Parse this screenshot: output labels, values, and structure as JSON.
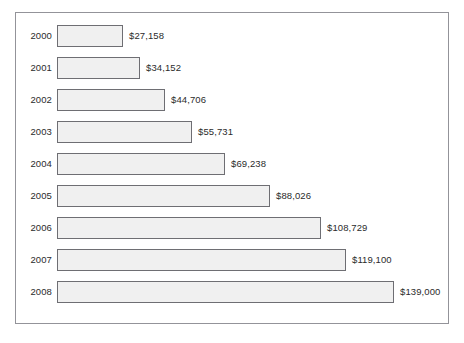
{
  "chart_data": {
    "type": "bar",
    "orientation": "horizontal",
    "title": "",
    "subtitle": "",
    "xlabel": "",
    "ylabel": "",
    "grid": false,
    "legend": false,
    "legend_position": "none",
    "axis_visible": false,
    "xlim": [
      0,
      139000
    ],
    "categories": [
      "2000",
      "2001",
      "2002",
      "2003",
      "2004",
      "2005",
      "2006",
      "2007",
      "2008"
    ],
    "values": [
      27158,
      34152,
      44706,
      55731,
      69238,
      88026,
      108729,
      119100,
      139000
    ],
    "value_labels": [
      "$27,158",
      "$34,152",
      "$44,706",
      "$55,731",
      "$69,238",
      "$88,026",
      "$108,729",
      "$119,100",
      "$139,000"
    ],
    "bars": [
      {
        "category": "2000",
        "value": 27158,
        "label": "$27,158"
      },
      {
        "category": "2001",
        "value": 34152,
        "label": "$34,152"
      },
      {
        "category": "2002",
        "value": 44706,
        "label": "$44,706"
      },
      {
        "category": "2003",
        "value": 55731,
        "label": "$55,731"
      },
      {
        "category": "2004",
        "value": 69238,
        "label": "$69,238"
      },
      {
        "category": "2005",
        "value": 88026,
        "label": "$88,026"
      },
      {
        "category": "2006",
        "value": 108729,
        "label": "$108,729"
      },
      {
        "category": "2007",
        "value": 119100,
        "label": "$119,100"
      },
      {
        "category": "2008",
        "value": 139000,
        "label": "$139,000"
      }
    ],
    "colors": {
      "bar_fill": "#f0f0f0",
      "bar_border": "#6e6e73",
      "frame_border": "#939399",
      "text": "#2b2b2b",
      "background": "#ffffff"
    }
  },
  "layout": {
    "bar_origin_x": 41,
    "bar_height": 22,
    "row_pitch": 32,
    "first_row_top": 12,
    "px_per_unit": 0.002424,
    "label_gap": 6
  }
}
